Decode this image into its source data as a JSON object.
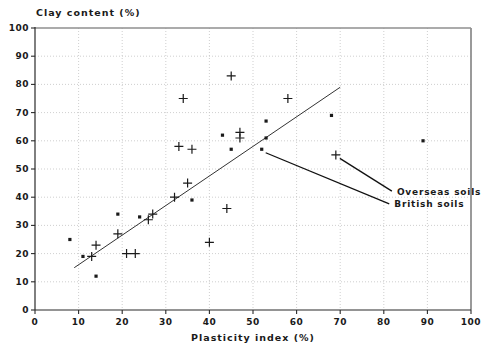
{
  "chart_data": {
    "type": "scatter",
    "title": "",
    "xlabel": "Plasticity index (%)",
    "ylabel": "Clay content (%)",
    "xlim": [
      0,
      100
    ],
    "ylim": [
      0,
      100
    ],
    "x_ticks": [
      0,
      10,
      20,
      30,
      40,
      50,
      60,
      70,
      80,
      90,
      100
    ],
    "y_ticks": [
      0,
      10,
      20,
      30,
      40,
      50,
      60,
      70,
      80,
      90,
      100
    ],
    "grid": "dotted",
    "legend_position": "annotated-in-plot",
    "series": [
      {
        "name": "Overseas soils",
        "marker": "plus",
        "points": [
          [
            13,
            19
          ],
          [
            14,
            23
          ],
          [
            19,
            27
          ],
          [
            21,
            20
          ],
          [
            23,
            20
          ],
          [
            26,
            32
          ],
          [
            27,
            34
          ],
          [
            32,
            40
          ],
          [
            35,
            45
          ],
          [
            40,
            24
          ],
          [
            44,
            36
          ],
          [
            33,
            58
          ],
          [
            36,
            57
          ],
          [
            34,
            75
          ],
          [
            45,
            83
          ],
          [
            47,
            63
          ],
          [
            47,
            61
          ],
          [
            58,
            75
          ],
          [
            69,
            55
          ]
        ]
      },
      {
        "name": "British soils",
        "marker": "square",
        "points": [
          [
            8,
            25
          ],
          [
            11,
            19
          ],
          [
            14,
            12
          ],
          [
            19,
            34
          ],
          [
            24,
            33
          ],
          [
            36,
            39
          ],
          [
            43,
            62
          ],
          [
            45,
            57
          ],
          [
            53,
            61
          ],
          [
            52,
            57
          ],
          [
            53,
            67
          ],
          [
            68,
            69
          ],
          [
            89,
            60
          ]
        ]
      }
    ],
    "trend_line": {
      "from": [
        9,
        15
      ],
      "to": [
        70,
        79
      ]
    },
    "annotations": [
      {
        "label": "Overseas soils",
        "target": [
          69,
          55
        ],
        "label_pos": [
          83,
          41.8
        ]
      },
      {
        "label": "British soils",
        "target": [
          52,
          57
        ],
        "label_pos": [
          82.4,
          37.3
        ]
      }
    ],
    "colors": {
      "marker": "#1a1a1a",
      "grid": "#c3c3c3",
      "axis": "#2a2a2a",
      "frame": "#8f8f8f",
      "trend_line": "#333333",
      "leader_line": "#111111"
    }
  }
}
